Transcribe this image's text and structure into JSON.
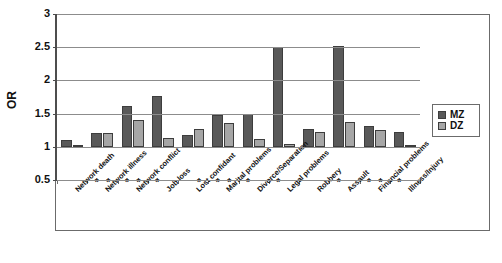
{
  "chart_data": {
    "type": "bar",
    "title": "",
    "xlabel": "",
    "ylabel": "OR",
    "ylim": [
      0.5,
      3
    ],
    "y_ticks": [
      "0.5",
      "1",
      "1.5",
      "2",
      "2.5",
      "3"
    ],
    "y_tick_values": [
      0.5,
      1,
      1.5,
      2,
      2.5,
      3
    ],
    "baseline": 1,
    "grid": true,
    "legend_position": "right",
    "categories": [
      "Network death",
      "Network illness",
      "Network conflict",
      "Job loss",
      "Lost confidant",
      "Marital problems",
      "Divorce/Separation",
      "Legal problems",
      "Robbery",
      "Assault",
      "Financial problems",
      "Illness/Injury"
    ],
    "series": [
      {
        "name": "MZ",
        "color": "#595959",
        "values": [
          1.1,
          1.21,
          1.62,
          1.77,
          1.18,
          1.48,
          1.5,
          2.51,
          1.27,
          2.52,
          1.31,
          1.23
        ]
      },
      {
        "name": "DZ",
        "color": "#a6a6a6",
        "values": [
          1.03,
          1.21,
          1.41,
          1.14,
          1.27,
          1.36,
          1.12,
          1.05,
          1.22,
          1.38,
          1.26,
          1.01
        ]
      }
    ],
    "significance_marker": "*",
    "significance": [
      {
        "category": "Network death",
        "MZ": false,
        "DZ": false
      },
      {
        "category": "Network illness",
        "MZ": true,
        "DZ": true
      },
      {
        "category": "Network conflict",
        "MZ": true,
        "DZ": true
      },
      {
        "category": "Job loss",
        "MZ": true,
        "DZ": false
      },
      {
        "category": "Lost confidant",
        "MZ": false,
        "DZ": true
      },
      {
        "category": "Marital problems",
        "MZ": true,
        "DZ": true
      },
      {
        "category": "Divorce/Separation",
        "MZ": true,
        "DZ": false
      },
      {
        "category": "Legal problems",
        "MZ": true,
        "DZ": false
      },
      {
        "category": "Robbery",
        "MZ": false,
        "DZ": false
      },
      {
        "category": "Assault",
        "MZ": true,
        "DZ": false
      },
      {
        "category": "Financial problems",
        "MZ": true,
        "DZ": true
      },
      {
        "category": "Illness/Injury",
        "MZ": true,
        "DZ": false
      }
    ]
  },
  "legend": {
    "items": [
      {
        "label": "MZ",
        "color": "#595959"
      },
      {
        "label": "DZ",
        "color": "#a6a6a6"
      }
    ]
  },
  "axis": {
    "y_title": "OR"
  }
}
